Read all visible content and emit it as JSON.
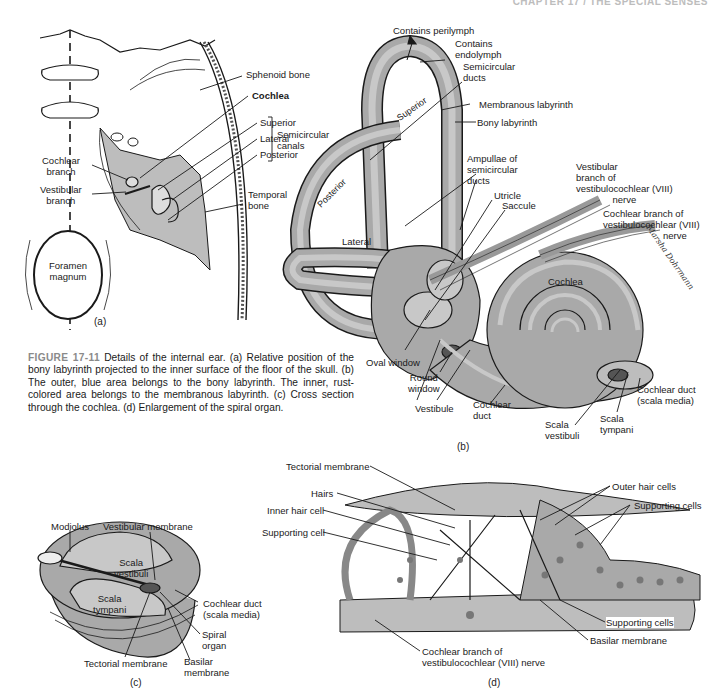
{
  "running_header": "CHAPTER 17 / THE SPECIAL SENSES",
  "figure": {
    "number": "FIGURE 17-11",
    "caption": "Details of the internal ear. (a) Relative position of the bony labyrinth projected to the inner surface of the floor of the skull. (b) The outer, blue area belongs to the bony labyrinth. The inner, rust-colored area belongs to the membranous labyrinth. (c) Cross section through the cochlea. (d) Enlargement of the spiral organ."
  },
  "panel_a": {
    "tag": "(a)",
    "labels": {
      "sphenoid": "Sphenoid bone",
      "cochlea": "Cochlea",
      "superior": "Superior",
      "lateral": "Lateral",
      "posterior": "Posterior",
      "semicircular_canals": [
        "Semicircular",
        "canals"
      ],
      "temporal_bone": [
        "Temporal",
        "bone"
      ],
      "cochlear_branch": [
        "Cochlear",
        "branch"
      ],
      "vestibular_branch": [
        "Vestibular",
        "branch"
      ],
      "foramen_magnum": [
        "Foramen",
        "magnum"
      ]
    }
  },
  "panel_b": {
    "tag": "(b)",
    "labels": {
      "contains_perilymph": "Contains perilymph",
      "contains_endolymph": [
        "Contains",
        "endolymph"
      ],
      "semicircular_ducts": [
        "Semicircular",
        "ducts"
      ],
      "membranous_labyrinth": "Membranous labyrinth",
      "bony_labyrinth": "Bony labyrinth",
      "ampullae": [
        "Ampullae of",
        "semicircular",
        "ducts"
      ],
      "vestibular_branch": [
        "Vestibular",
        "branch of",
        "vestibulocochlear (VIII)",
        "nerve"
      ],
      "cochlear_branch": [
        "Cochlear branch of",
        "vestibulocochlear (VIII)",
        "nerve"
      ],
      "utricle": "Utricle",
      "saccule": "Saccule",
      "superior": "Superior",
      "posterior": "Posterior",
      "lateral": "Lateral",
      "cochlea": "Cochlea",
      "oval_window": "Oval window",
      "round_window": [
        "Round",
        "window"
      ],
      "vestibule": "Vestibule",
      "cochlear_duct": [
        "Cochlear",
        "duct"
      ],
      "scala_vestibuli": [
        "Scala",
        "vestibuli"
      ],
      "scala_tympani": [
        "Scala",
        "tympani"
      ],
      "cochlear_duct_media": [
        "Cochlear duct",
        "(scala media)"
      ],
      "signature": "Marsha Dohrmann"
    }
  },
  "panel_c": {
    "tag": "(c)",
    "labels": {
      "modiolus": "Modiolus",
      "vestibular_membrane": "Vestibular membrane",
      "scala_vestibuli": [
        "Scala",
        "vestibuli"
      ],
      "scala_tympani": [
        "Scala",
        "tympani"
      ],
      "cochlear_duct": [
        "Cochlear duct",
        "(scala media)"
      ],
      "spiral_organ": [
        "Spiral",
        "organ"
      ],
      "tectorial_membrane": "Tectorial membrane",
      "basilar_membrane": [
        "Basilar",
        "membrane"
      ]
    }
  },
  "panel_d": {
    "tag": "(d)",
    "labels": {
      "tectorial_membrane": "Tectorial membrane",
      "hairs": "Hairs",
      "inner_hair_cell": "Inner hair cell",
      "supporting_cell": "Supporting cell",
      "outer_hair_cells": "Outer hair cells",
      "supporting_cells_top": "Supporting cells",
      "supporting_cells_bottom": "Supporting cells",
      "basilar_membrane": "Basilar membrane",
      "cochlear_branch": [
        "Cochlear branch of",
        "vestibulocochlear (VIII) nerve"
      ]
    }
  },
  "colors": {
    "bony": "#a9a9a9",
    "membranous": "#c8c8c8",
    "line": "#1a1a1a",
    "figure_label": "#8a8a8a"
  }
}
